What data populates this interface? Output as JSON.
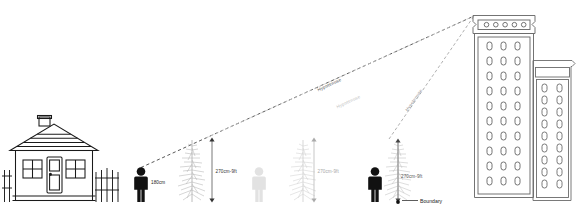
{
  "diagram": {
    "colors": {
      "ink": "#1a1a1a",
      "line_near": "#3a3a3a",
      "line_mid": "#c9c9c9",
      "line_far": "#9a9a9a",
      "building_outline": "#6b6b6b",
      "tree_near": "#b4b4b4",
      "tree_mid": "#d2d2d2",
      "tree_far": "#c0c0c0",
      "person_near": "#111111",
      "person_mid": "#e2e2e2",
      "person_far": "#111111",
      "text": "#4a4a4a",
      "text_dark": "#222222"
    },
    "house": {
      "name": "detached-house",
      "window_count": 2,
      "door_count": 1,
      "chimney": true,
      "roof_lines": 4,
      "fence_left_pickets": 2,
      "fence_right_pickets": 5
    },
    "observers": [
      {
        "id": "observer-1",
        "label": "180cm",
        "tone": "dark"
      },
      {
        "id": "observer-2",
        "label": "",
        "tone": "faded"
      },
      {
        "id": "observer-3",
        "label": "",
        "tone": "dark"
      }
    ],
    "trees": [
      {
        "id": "tree-1",
        "height_label": "270cm-9ft"
      },
      {
        "id": "tree-2",
        "height_label": "270cm-9ft"
      },
      {
        "id": "tree-3",
        "height_label": "270cm-9ft"
      }
    ],
    "sight_lines": [
      {
        "id": "sightline-1",
        "label": "Hypotenuse",
        "style": "dashed-dark"
      },
      {
        "id": "sightline-2",
        "label": "Hypotenuse",
        "style": "dashed-light"
      },
      {
        "id": "sightline-3",
        "label": "Hypotenuse",
        "style": "dashed-mid"
      }
    ],
    "annotations": {
      "boundary_label": "Boundary"
    },
    "buildings": [
      {
        "id": "tower-main",
        "window_columns": 3,
        "window_rows": 10,
        "roof_porthole_count": 5
      },
      {
        "id": "tower-secondary",
        "window_columns": 2,
        "window_rows": 9,
        "roof_porthole_count": 0
      }
    ]
  }
}
